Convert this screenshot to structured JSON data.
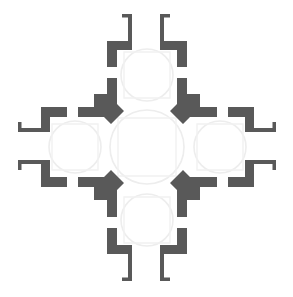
{
  "document": {
    "type": "architectural-floor-plan",
    "title": "Greek-cross centrally planned church floor plan",
    "orientation": "plan view",
    "background_color": "#ffffff",
    "wall_color": "#595959",
    "vault_outline_color": "#ededed",
    "void_color": "#ffffff",
    "canvas": {
      "width": 293,
      "height": 297
    }
  },
  "plan": {
    "scheme": "greek-cross",
    "symmetry": "four-fold / quadrilateral symmetry about center",
    "central_space": {
      "name": "central-domed-bay",
      "shape": "square with chamfered corners, circular dome outline",
      "center_x": 147,
      "center_y": 147,
      "dome_radius": 38,
      "wall_thickness": 10
    },
    "arms": [
      {
        "id": "north",
        "name": "north-arm-chapel",
        "label": "North arm",
        "direction": "up",
        "has_dome": true,
        "has_porch": true,
        "porch_type": "twin-pilaster-entry",
        "chapel_dome_radius": 27
      },
      {
        "id": "east",
        "name": "east-arm-chapel",
        "label": "East arm",
        "direction": "right",
        "has_dome": true,
        "has_porch": true,
        "porch_type": "twin-pilaster-entry",
        "chapel_dome_radius": 27
      },
      {
        "id": "south",
        "name": "south-arm-chapel",
        "label": "South arm",
        "direction": "down",
        "has_dome": true,
        "has_porch": true,
        "porch_type": "twin-pilaster-entry",
        "chapel_dome_radius": 27
      },
      {
        "id": "west",
        "name": "west-arm-chapel",
        "label": "West arm",
        "direction": "left",
        "has_dome": true,
        "has_porch": true,
        "porch_type": "twin-pilaster-entry",
        "chapel_dome_radius": 27
      }
    ],
    "corner_piers": [
      {
        "id": "nw",
        "name": "corner-pier-northwest",
        "chamfer": "facing-center"
      },
      {
        "id": "ne",
        "name": "corner-pier-northeast",
        "chamfer": "facing-center"
      },
      {
        "id": "sw",
        "name": "corner-pier-southwest",
        "chamfer": "facing-center"
      },
      {
        "id": "se",
        "name": "corner-pier-southeast",
        "chamfer": "facing-center"
      }
    ],
    "openings": {
      "description": "Door/window gaps at the mid-point of each chapel perimeter wall",
      "count_per_chapel": 3
    }
  }
}
